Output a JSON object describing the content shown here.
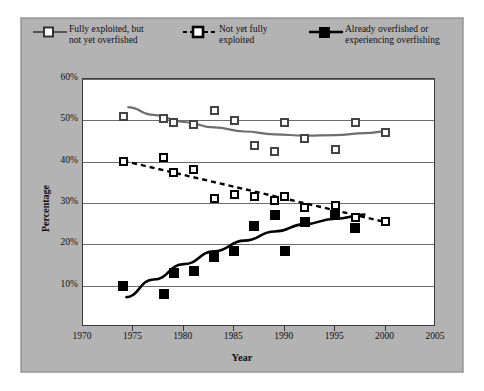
{
  "chart_data": {
    "type": "scatter",
    "title": "",
    "xlabel": "Year",
    "ylabel": "Percentage",
    "xlim": [
      1970,
      2005
    ],
    "ylim": [
      0,
      60
    ],
    "xticks": [
      1970,
      1975,
      1980,
      1985,
      1990,
      1995,
      2000,
      2005
    ],
    "xtick_labels": [
      "1970",
      "1975",
      "1980",
      "1985",
      "1990",
      "1995",
      "2000",
      "2005"
    ],
    "yticks": [
      10,
      20,
      30,
      40,
      50,
      60
    ],
    "ytick_labels": [
      "10%",
      "20%",
      "30%",
      "40%",
      "50%",
      "60%"
    ],
    "grid": "horizontal",
    "legend_position": "top",
    "series": [
      {
        "name": "Fully exploited, but not yet overfished",
        "legend_label_line1": "Fully exploited, but",
        "legend_label_line2": "not yet overfished",
        "marker": "open-square",
        "color": "#6e6e6e",
        "linestyle": "solid-trend",
        "x": [
          1974,
          1978,
          1979,
          1981,
          1983,
          1985,
          1987,
          1989,
          1990,
          1992,
          1995,
          1997,
          2000
        ],
        "y": [
          51.0,
          50.5,
          49.5,
          49.0,
          52.5,
          50.0,
          44.0,
          42.5,
          49.5,
          45.5,
          43.0,
          49.5,
          47.0
        ]
      },
      {
        "name": "Not yet fully exploited",
        "legend_label_line1": "Not yet fully",
        "legend_label_line2": "exploited",
        "marker": "open-square",
        "color": "#000000",
        "linestyle": "dashed-trend",
        "x": [
          1974,
          1978,
          1979,
          1981,
          1983,
          1985,
          1987,
          1989,
          1990,
          1992,
          1995,
          1997,
          2000
        ],
        "y": [
          40.0,
          41.0,
          37.5,
          38.0,
          31.0,
          32.0,
          31.5,
          30.5,
          31.5,
          29.0,
          29.5,
          26.5,
          25.5
        ]
      },
      {
        "name": "Already overfished or experiencing overfishing",
        "legend_label_line1": "Already overfished or",
        "legend_label_line2": "experiencing overfishing",
        "marker": "filled-square",
        "color": "#000000",
        "linestyle": "solid-trend",
        "x": [
          1974,
          1978,
          1979,
          1981,
          1983,
          1985,
          1987,
          1989,
          1990,
          1992,
          1995,
          1997
        ],
        "y": [
          10.0,
          8.0,
          13.0,
          13.5,
          17.0,
          18.5,
          24.5,
          27.0,
          18.5,
          25.5,
          27.0,
          24.0
        ]
      }
    ],
    "trendlines": [
      {
        "series": "Fully exploited, but not yet overfished",
        "type": "quadratic",
        "points": [
          [
            1974.4,
            53.2
          ],
          [
            1977,
            51.3
          ],
          [
            1980,
            49.6
          ],
          [
            1983,
            48.3
          ],
          [
            1986,
            47.3
          ],
          [
            1989,
            46.6
          ],
          [
            1992,
            46.3
          ],
          [
            1995,
            46.4
          ],
          [
            1998,
            46.9
          ],
          [
            2000.3,
            47.4
          ]
        ]
      },
      {
        "series": "Not yet fully exploited",
        "type": "linear",
        "points": [
          [
            1974,
            40.2
          ],
          [
            2000.3,
            25.2
          ]
        ]
      },
      {
        "series": "Already overfished or experiencing overfishing",
        "type": "quadratic",
        "points": [
          [
            1974.2,
            7.2
          ],
          [
            1977,
            11.5
          ],
          [
            1980,
            15.2
          ],
          [
            1983,
            18.3
          ],
          [
            1986,
            20.9
          ],
          [
            1989,
            23.1
          ],
          [
            1992,
            24.9
          ],
          [
            1995,
            26.2
          ],
          [
            1998,
            27.2
          ]
        ]
      }
    ]
  },
  "colors": {
    "panel_background": "#b3b3b3",
    "plot_background": "#ffffff",
    "gridline": "#6d6d6d",
    "axis": "#3a3a3a",
    "series_gray": "#6e6e6e",
    "series_black": "#000000"
  }
}
